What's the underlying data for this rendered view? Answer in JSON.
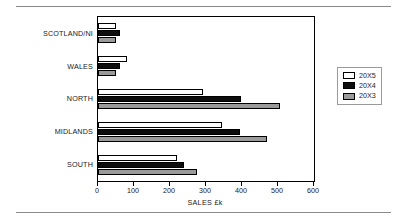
{
  "chart_data": {
    "type": "bar",
    "orientation": "horizontal",
    "title": "",
    "xlabel": "SALES £k",
    "ylabel": "",
    "xlim": [
      0,
      600
    ],
    "xticks": [
      0,
      100,
      200,
      300,
      400,
      500,
      600
    ],
    "xtick_labels": [
      "0",
      "100",
      "200",
      "300",
      "400",
      "500",
      "600"
    ],
    "grid": false,
    "legend_position": "right",
    "categories": [
      "SCOTLAND/NI",
      "WALES",
      "NORTH",
      "MIDLANDS",
      "SOUTH"
    ],
    "series": [
      {
        "name": "20X5",
        "color": "#ffffff",
        "values": [
          50,
          80,
          293,
          345,
          220
        ]
      },
      {
        "name": "20X4",
        "color": "#0d0d0d",
        "values": [
          62,
          60,
          397,
          395,
          240
        ]
      },
      {
        "name": "20X3",
        "color": "#9a9a9a",
        "values": [
          50,
          50,
          505,
          470,
          275
        ]
      }
    ]
  },
  "legend": {
    "entries": [
      {
        "label": "20X5"
      },
      {
        "label": "20X4"
      },
      {
        "label": "20X3"
      }
    ]
  }
}
